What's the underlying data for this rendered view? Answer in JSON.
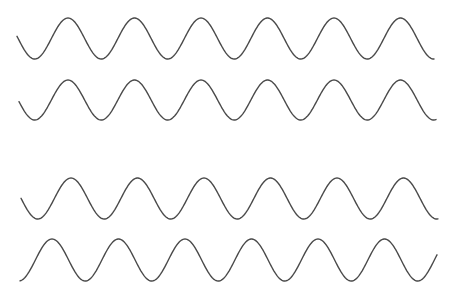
{
  "title": "",
  "waves": [
    {
      "name": "wave-1",
      "phase": "starts descending toward trough",
      "cycles_visible": 6.5
    },
    {
      "name": "wave-2",
      "phase": "starts descending toward trough",
      "cycles_visible": 6.5
    },
    {
      "name": "wave-3",
      "phase": "starts descending toward trough",
      "cycles_visible": 6.5
    },
    {
      "name": "wave-4",
      "phase": "starts at trough rising",
      "cycles_visible": 6.5
    }
  ],
  "colors": {
    "stroke": "#4a4a4a",
    "background": "#ffffff"
  }
}
